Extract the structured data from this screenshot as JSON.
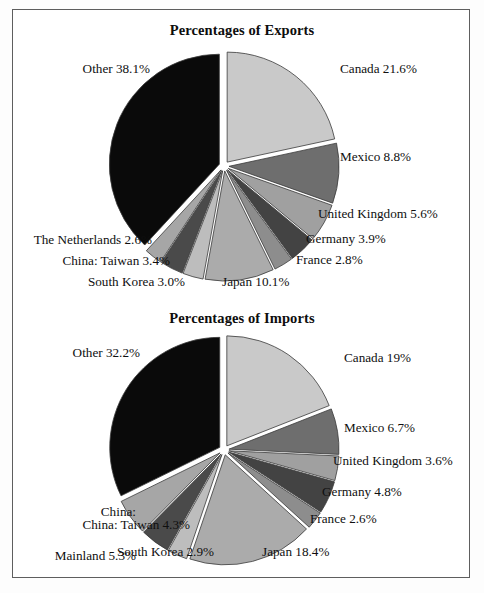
{
  "figure": {
    "background_color": "#ffffff",
    "frame_color": "#5e5e5e"
  },
  "charts": [
    {
      "id": "exports",
      "title": "Percentages of Exports",
      "labels": {
        "canada": "Canada 21.6%",
        "mexico": "Mexico 8.8%",
        "united_kingdom": "United Kingdom 5.6%",
        "germany": "Germany 3.9%",
        "france": "France 2.8%",
        "japan": "Japan 10.1%",
        "south_korea": "South Korea 3.0%",
        "china_taiwan": "China: Taiwan 3.4%",
        "netherlands": "The Netherlands 2.6%",
        "other": "Other 38.1%"
      }
    },
    {
      "id": "imports",
      "title": "Percentages of Imports",
      "labels": {
        "canada": "Canada 19%",
        "mexico": "Mexico 6.7%",
        "united_kingdom": "United Kingdom 3.6%",
        "germany": "Germany 4.8%",
        "france": "France 2.6%",
        "japan": "Japan 18.4%",
        "south_korea": "South Korea 2.9%",
        "china_taiwan": "China: Taiwan 4.3%",
        "china_mainland_line1": "China:",
        "china_mainland_line2": "Mainland 5.3%",
        "other": "Other 32.2%"
      }
    }
  ],
  "chart_data": [
    {
      "type": "pie",
      "title": "Percentages of Exports",
      "xlabel": "",
      "ylabel": "",
      "legend_position": "none",
      "grid": false,
      "exploded": true,
      "start_angle_deg": -90,
      "direction": "clockwise",
      "units": "percent",
      "categories": [
        "Canada",
        "Mexico",
        "United Kingdom",
        "Germany",
        "France",
        "Japan",
        "South Korea",
        "China: Taiwan",
        "The Netherlands",
        "Other"
      ],
      "values": [
        21.6,
        8.8,
        5.6,
        3.9,
        2.8,
        10.1,
        3.0,
        3.4,
        2.6,
        38.1
      ],
      "value_labels": [
        "21.6%",
        "8.8%",
        "5.6%",
        "3.9%",
        "2.8%",
        "10.1%",
        "3.0%",
        "3.4%",
        "2.6%",
        "38.1%"
      ],
      "slice_colors": [
        "#c9c9c9",
        "#6e6e6e",
        "#a0a0a0",
        "#434343",
        "#8d8d8d",
        "#ababab",
        "#bdbdbd",
        "#4a4a4a",
        "#a6a6a6",
        "#0a0a0a"
      ]
    },
    {
      "type": "pie",
      "title": "Percentages of Imports",
      "xlabel": "",
      "ylabel": "",
      "legend_position": "none",
      "grid": false,
      "exploded": true,
      "start_angle_deg": -90,
      "direction": "clockwise",
      "units": "percent",
      "categories": [
        "Canada",
        "Mexico",
        "United Kingdom",
        "Germany",
        "France",
        "Japan",
        "South Korea",
        "China: Taiwan",
        "China: Mainland",
        "Other"
      ],
      "values": [
        19.0,
        6.7,
        3.6,
        4.8,
        2.6,
        18.4,
        2.9,
        4.3,
        5.3,
        32.2
      ],
      "value_labels": [
        "19%",
        "6.7%",
        "3.6%",
        "4.8%",
        "2.6%",
        "18.4%",
        "2.9%",
        "4.3%",
        "5.3%",
        "32.2%"
      ],
      "slice_colors": [
        "#c9c9c9",
        "#6e6e6e",
        "#a0a0a0",
        "#434343",
        "#8d8d8d",
        "#ababab",
        "#bdbdbd",
        "#4a4a4a",
        "#a6a6a6",
        "#0a0a0a"
      ]
    }
  ],
  "layout": {
    "exports": {
      "center_x": 224,
      "center_y": 166,
      "radius": 110,
      "label_positions": {
        "canada": {
          "x": 340,
          "y": 68,
          "align": "right"
        },
        "mexico": {
          "x": 340,
          "y": 156,
          "align": "right"
        },
        "united_kingdom": {
          "x": 318,
          "y": 213,
          "align": "right"
        },
        "germany": {
          "x": 306,
          "y": 238,
          "align": "right"
        },
        "france": {
          "x": 296,
          "y": 259,
          "align": "right"
        },
        "japan": {
          "x": 222,
          "y": 280,
          "align": "right"
        },
        "south_korea": {
          "x": 185,
          "y": 280,
          "align": "left"
        },
        "china_taiwan": {
          "x": 170,
          "y": 259,
          "align": "left"
        },
        "netherlands": {
          "x": 152,
          "y": 238,
          "align": "left"
        },
        "other": {
          "x": 150,
          "y": 68,
          "align": "left"
        }
      }
    },
    "imports": {
      "center_x": 224,
      "center_y": 450,
      "radius": 110,
      "label_positions": {
        "canada": {
          "x": 344,
          "y": 357,
          "align": "right"
        },
        "mexico": {
          "x": 344,
          "y": 427,
          "align": "right"
        },
        "united_kingdom": {
          "x": 334,
          "y": 460,
          "align": "right"
        },
        "germany": {
          "x": 322,
          "y": 491,
          "align": "right"
        },
        "france": {
          "x": 310,
          "y": 518,
          "align": "right"
        },
        "japan": {
          "x": 262,
          "y": 551,
          "align": "right"
        },
        "south_korea": {
          "x": 214,
          "y": 551,
          "align": "left"
        },
        "china_taiwan": {
          "x": 190,
          "y": 524,
          "align": "left"
        },
        "china_mainland": {
          "x": 136,
          "y": 493,
          "align": "left"
        },
        "other": {
          "x": 140,
          "y": 352,
          "align": "left"
        }
      }
    }
  }
}
